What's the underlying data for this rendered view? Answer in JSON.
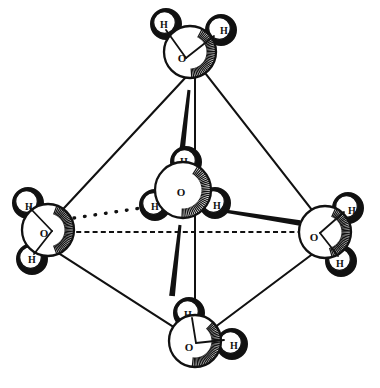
{
  "figure": {
    "kind": "molecular-structure-diagram",
    "style": "ink line drawing, radial hatch shading, white fill",
    "background_color": "#ffffff",
    "ink_color": "#111111",
    "width": 380,
    "height": 388
  },
  "atom_labels": {
    "oxygen": "O",
    "hydrogen": "H"
  },
  "molecules": [
    {
      "id": "water-top",
      "name": "top-water-molecule",
      "oxygen": {
        "label": "O",
        "cx": 190,
        "cy": 52,
        "r": 26,
        "label_x": 182,
        "label_y": 58,
        "font_size": 11
      },
      "hydrogens": [
        {
          "label": "H",
          "cx": 166,
          "cy": 24,
          "r": 15,
          "label_x": 164,
          "label_y": 24,
          "font_size": 10,
          "dark": true
        },
        {
          "label": "H",
          "cx": 221,
          "cy": 30,
          "r": 15,
          "label_x": 224,
          "label_y": 30,
          "font_size": 10,
          "dark": true
        }
      ],
      "hatch": {
        "cx": 190,
        "cy": 52,
        "r": 26,
        "start": -62,
        "end": 86
      },
      "bonds": [
        {
          "from": [
            186,
            58
          ],
          "to": [
            166,
            30
          ]
        },
        {
          "from": [
            186,
            58
          ],
          "to": [
            214,
            36
          ]
        }
      ]
    },
    {
      "id": "water-left",
      "name": "left-water-molecule",
      "oxygen": {
        "label": "O",
        "cx": 48,
        "cy": 230,
        "r": 26,
        "label_x": 44,
        "label_y": 233,
        "font_size": 11
      },
      "hydrogens": [
        {
          "label": "H",
          "cx": 28,
          "cy": 203,
          "r": 15,
          "label_x": 29,
          "label_y": 206,
          "font_size": 10,
          "dark": true
        },
        {
          "label": "H",
          "cx": 32,
          "cy": 259,
          "r": 15,
          "label_x": 32,
          "label_y": 259,
          "font_size": 10,
          "dark": true
        }
      ],
      "hatch": {
        "cx": 48,
        "cy": 230,
        "r": 26,
        "start": -70,
        "end": 70
      },
      "bonds": [
        {
          "from": [
            52,
            231
          ],
          "to": [
            30,
            208
          ]
        },
        {
          "from": [
            52,
            231
          ],
          "to": [
            34,
            254
          ]
        }
      ]
    },
    {
      "id": "water-right",
      "name": "right-water-molecule",
      "oxygen": {
        "label": "O",
        "cx": 325,
        "cy": 232,
        "r": 26,
        "label_x": 314,
        "label_y": 237,
        "font_size": 11
      },
      "hydrogens": [
        {
          "label": "H",
          "cx": 348,
          "cy": 208,
          "r": 15,
          "label_x": 352,
          "label_y": 210,
          "font_size": 10,
          "dark": true
        },
        {
          "label": "H",
          "cx": 341,
          "cy": 261,
          "r": 15,
          "label_x": 340,
          "label_y": 263,
          "font_size": 10,
          "dark": true
        }
      ],
      "hatch": {
        "cx": 325,
        "cy": 232,
        "r": 26,
        "start": -66,
        "end": 74
      },
      "bonds": [
        {
          "from": [
            320,
            233
          ],
          "to": [
            344,
            212
          ]
        },
        {
          "from": [
            320,
            233
          ],
          "to": [
            338,
            256
          ]
        }
      ]
    },
    {
      "id": "water-bottom",
      "name": "bottom-water-molecule",
      "oxygen": {
        "label": "O",
        "cx": 195,
        "cy": 341,
        "r": 26,
        "label_x": 189,
        "label_y": 347,
        "font_size": 11
      },
      "hydrogens": [
        {
          "label": "H",
          "cx": 189,
          "cy": 313,
          "r": 15,
          "label_x": 188,
          "label_y": 314,
          "font_size": 10,
          "dark": true
        },
        {
          "label": "H",
          "cx": 232,
          "cy": 344,
          "r": 15,
          "label_x": 234,
          "label_y": 345,
          "font_size": 10,
          "dark": true
        }
      ],
      "hatch": {
        "cx": 195,
        "cy": 341,
        "r": 26,
        "start": -46,
        "end": 96
      },
      "bonds": [
        {
          "from": [
            196,
            343
          ],
          "to": [
            192,
            318
          ]
        },
        {
          "from": [
            196,
            343
          ],
          "to": [
            224,
            340
          ]
        }
      ]
    },
    {
      "id": "water-center",
      "name": "center-water-molecule",
      "oxygen": {
        "label": "O",
        "cx": 183,
        "cy": 190,
        "r": 28,
        "label_x": 181,
        "label_y": 192,
        "font_size": 11
      },
      "hydrogens": [
        {
          "label": "H",
          "cx": 186,
          "cy": 162,
          "r": 15,
          "label_x": 184,
          "label_y": 161,
          "font_size": 10,
          "dark": true
        },
        {
          "label": "H",
          "cx": 155,
          "cy": 205,
          "r": 15,
          "label_x": 155,
          "label_y": 206,
          "font_size": 10,
          "dark": true
        },
        {
          "label": "H",
          "cx": 215,
          "cy": 203,
          "r": 15,
          "label_x": 217,
          "label_y": 205,
          "font_size": 10,
          "dark": true
        }
      ],
      "hatch": {
        "cx": 183,
        "cy": 190,
        "r": 28,
        "start": -58,
        "end": 92
      },
      "bonds": []
    }
  ],
  "octahedron_edges": [
    {
      "name": "edge-top-left",
      "from": [
        188,
        75
      ],
      "to": [
        58,
        214
      ]
    },
    {
      "name": "edge-top-right",
      "from": [
        205,
        73
      ],
      "to": [
        315,
        214
      ]
    },
    {
      "name": "edge-bottom-left",
      "from": [
        52,
        248
      ],
      "to": [
        178,
        330
      ]
    },
    {
      "name": "edge-bottom-right",
      "from": [
        318,
        250
      ],
      "to": [
        212,
        330
      ]
    }
  ],
  "axes": [
    {
      "name": "vertical-axis-line",
      "from": [
        195,
        74
      ],
      "to": [
        195,
        318
      ],
      "style": "solid"
    },
    {
      "name": "horizontal-axis-line",
      "from": [
        68,
        232
      ],
      "to": [
        310,
        232
      ],
      "style": "dashed"
    }
  ],
  "coordination_bonds": [
    {
      "name": "bond-center-to-top",
      "from": [
        189,
        90
      ],
      "to": [
        181,
        160
      ],
      "style": "tapered-solid"
    },
    {
      "name": "bond-center-to-bottom",
      "from": [
        180,
        225
      ],
      "to": [
        172,
        296
      ],
      "style": "tapered-solid"
    },
    {
      "name": "bond-center-to-left",
      "from": [
        148,
        207
      ],
      "to": [
        74,
        218
      ],
      "style": "dotted"
    },
    {
      "name": "bond-center-to-right",
      "from": [
        218,
        210
      ],
      "to": [
        300,
        223
      ],
      "style": "tapered-solid"
    }
  ]
}
